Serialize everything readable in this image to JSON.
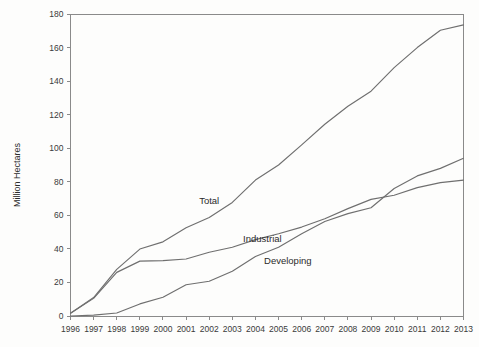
{
  "chart_data": {
    "type": "line",
    "title": "",
    "subtitle": "",
    "xlabel": "",
    "ylabel": "Million Hectares",
    "xlim": [
      1996,
      2013
    ],
    "ylim": [
      0,
      180
    ],
    "ytick_step": 20,
    "grid": false,
    "legend": "inline-labels",
    "x": [
      1996,
      1997,
      1998,
      1999,
      2000,
      2001,
      2002,
      2003,
      2004,
      2005,
      2006,
      2007,
      2008,
      2009,
      2010,
      2011,
      2012,
      2013
    ],
    "categories": [
      "1996",
      "1997",
      "1998",
      "1999",
      "2000",
      "2001",
      "2002",
      "2003",
      "2004",
      "2005",
      "2006",
      "2007",
      "2008",
      "2009",
      "2010",
      "2011",
      "2012",
      "2013"
    ],
    "yticks": [
      0,
      20,
      40,
      60,
      80,
      100,
      120,
      140,
      160,
      180
    ],
    "ytick_labels": [
      "0",
      "20",
      "40",
      "60",
      "80",
      "100",
      "120",
      "140",
      "160",
      "180"
    ],
    "series": [
      {
        "name": "Total",
        "color": "#6f6f6f",
        "label_x": 2002.0,
        "label_y": 67,
        "values": [
          1.7,
          11.0,
          27.8,
          39.9,
          44.2,
          52.6,
          58.7,
          67.7,
          81.0,
          90.0,
          102.0,
          114.3,
          125.0,
          134.0,
          148.0,
          160.0,
          170.3,
          173.5
        ]
      },
      {
        "name": "Industrial",
        "color": "#6f6f6f",
        "label_x": 2004.3,
        "label_y": 44,
        "values": [
          1.7,
          10.5,
          26.0,
          32.7,
          33.0,
          34.0,
          38.0,
          41.0,
          45.5,
          49.0,
          53.0,
          58.0,
          64.0,
          69.5,
          72.0,
          76.5,
          79.5,
          81.0
        ]
      },
      {
        "name": "Developing",
        "color": "#6f6f6f",
        "label_x": 2005.4,
        "label_y": 31,
        "values": [
          0.0,
          0.5,
          1.8,
          7.2,
          11.2,
          18.6,
          20.7,
          26.7,
          35.5,
          41.0,
          49.0,
          56.3,
          61.0,
          64.5,
          76.0,
          83.5,
          88.0,
          94.0
        ]
      }
    ]
  },
  "axes": {
    "y_axis_title": "Million Hectares"
  }
}
